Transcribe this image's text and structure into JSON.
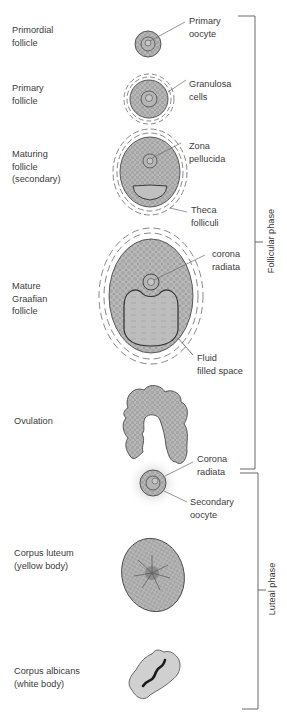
{
  "colors": {
    "cell_fill": "#9a9a9a",
    "cell_line": "#d0d0d0",
    "outline": "#4a4a4a",
    "fluid": "#bdbdbd",
    "bracket": "#5a5a5a",
    "text": "#3b3b3b"
  },
  "stages": [
    {
      "id": "primordial",
      "label": "Primordial\nfollicle"
    },
    {
      "id": "primary",
      "label": "Primary\nfollicle"
    },
    {
      "id": "maturing",
      "label": "Maturing\nfollicle\n(secondary)"
    },
    {
      "id": "mature",
      "label": "Mature\nGraafian\nfollicle"
    },
    {
      "id": "ovulation",
      "label": "Ovulation"
    },
    {
      "id": "corpus_luteum",
      "label": "Corpus luteum\n(yellow body)"
    },
    {
      "id": "corpus_albicans",
      "label": "Corpus albicans\n(white body)"
    }
  ],
  "parts": [
    {
      "id": "primary_oocyte",
      "label": "Primary\noocyte"
    },
    {
      "id": "granulosa",
      "label": "Granulosa\ncells"
    },
    {
      "id": "zona",
      "label": "Zona\npellucida"
    },
    {
      "id": "theca",
      "label": "Theca\nfolliculi"
    },
    {
      "id": "corona_1",
      "label": "corona\nradiata"
    },
    {
      "id": "fluid",
      "label": "Fluid\nfilled space"
    },
    {
      "id": "corona_2",
      "label": "Corona\nradiata"
    },
    {
      "id": "secondary_oocyte",
      "label": "Secondary\noocyte"
    }
  ],
  "phases": [
    {
      "id": "follicular",
      "label": "Follicular phase"
    },
    {
      "id": "luteal",
      "label": "Luteal phase"
    }
  ]
}
